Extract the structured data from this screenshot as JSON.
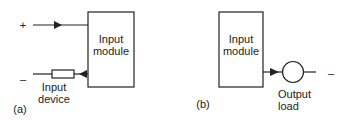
{
  "diagram_a": {
    "tag": "(a)",
    "module_label_line1": "Input",
    "module_label_line2": "module",
    "plus": "+",
    "minus": "–",
    "device_label_line1": "Input",
    "device_label_line2": "device"
  },
  "diagram_b": {
    "tag": "(b)",
    "module_label_line1": "Input",
    "module_label_line2": "module",
    "minus": "–",
    "load_label_line1": "Output",
    "load_label_line2": "load"
  }
}
